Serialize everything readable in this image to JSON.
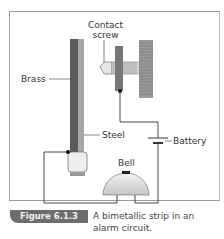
{
  "figure": {
    "number": "Figure 6.1.3",
    "caption": "A bimetallic strip in an alarm circuit."
  },
  "labels": {
    "contact_screw": "Contact\nscrew",
    "contact_screw_line1": "Contact",
    "contact_screw_line2": "screw",
    "brass": "Brass",
    "steel": "Steel",
    "battery": "Battery",
    "bell": "Bell"
  },
  "colors": {
    "brass": "#5a5a5a",
    "steel": "#a8a8a8",
    "caption_tag": "#6d6d6d",
    "wire": "#333333"
  }
}
